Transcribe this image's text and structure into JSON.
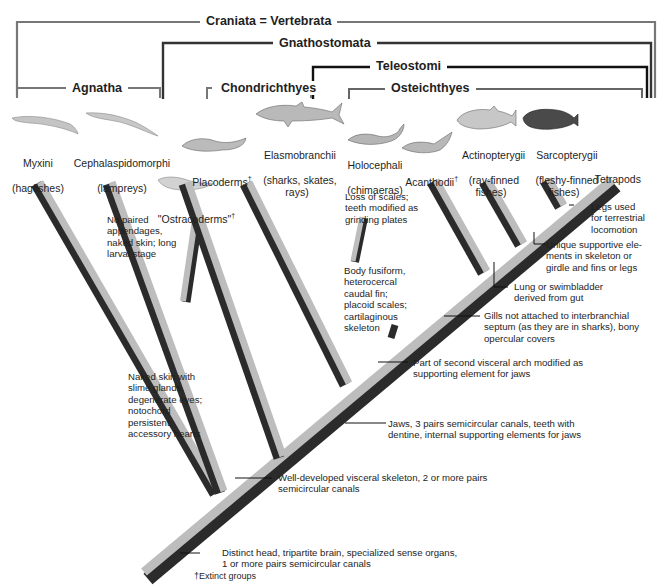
{
  "clades": {
    "craniata": "Craniata = Vertebrata",
    "gnathostomata": "Gnathostomata",
    "teleostomi": "Teleostomi",
    "osteichthyes": "Osteichthyes",
    "agnatha": "Agnatha",
    "chondrichthyes": "Chondrichthyes"
  },
  "taxa": [
    {
      "id": "myxini",
      "name": "Myxini",
      "common": "(hagfishes)",
      "extinct": false
    },
    {
      "id": "cephalaspidomorphi",
      "name": "Cephalaspidomorphi",
      "common": "(lampreys)",
      "extinct": false
    },
    {
      "id": "ostracoderms",
      "name": "\"Ostracoderms\"",
      "common": "",
      "extinct": true
    },
    {
      "id": "placoderms",
      "name": "Placoderms",
      "common": "",
      "extinct": true
    },
    {
      "id": "elasmobranchii",
      "name": "Elasmobranchii",
      "common": "(sharks, skates,\nrays)",
      "extinct": false
    },
    {
      "id": "holocephali",
      "name": "Holocephali",
      "common": "(chimaeras)",
      "extinct": false
    },
    {
      "id": "acanthodii",
      "name": "Acanthodii",
      "common": "",
      "extinct": true
    },
    {
      "id": "actinopterygii",
      "name": "Actinopterygii",
      "common": "(ray-finned\nfishes)",
      "extinct": false
    },
    {
      "id": "sarcopterygii",
      "name": "Sarcopterygii",
      "common": "(fleshy-finned\nfishes)",
      "extinct": false
    },
    {
      "id": "tetrapods",
      "name": "Tetrapods",
      "common": "",
      "extinct": false
    }
  ],
  "extinct_mark": "†",
  "characters": {
    "agnatha_lampreys": "No paired\nappendages,\nnaked skin; long\nlarval stage",
    "hagfish": "Naked skin with\nslime glands,\ndegenerate eyes;\nnotochord\npersistent;\naccessory hearts",
    "chimaera": "Loss of scales;\nteeth modified as\ngrinding plates",
    "chondrichthyes": "Body fusiform,\nheterocercal\ncaudal fin;\nplacoid scales;\ncartilaginous\nskeleton",
    "tetrapods": "Legs used\nfor terrestrial\nlocomotion",
    "sarcopterygii": "Unique supportive ele-\nments in skeleton or\ngirdle and fins or legs",
    "osteichthyes": "Lung or swimbladder\nderived from gut",
    "teleostomi": "Gills not attached to interbranchial\nseptum (as they are in sharks), bony\nopercular covers",
    "acanthodii_node": "Part of second visceral arch modified as\nsupporting element for jaws",
    "gnathostomata": "Jaws, 3 pairs semicircular canals, teeth with\ndentine, internal supporting elements for jaws",
    "vertebrata_node": "Well-developed visceral skeleton, 2 or more pairs\nsemicircular canals",
    "craniata": "Distinct head, tripartite brain, specialized sense organs,\n1 or more pairs semicircular canals"
  },
  "footnote": "†Extinct groups",
  "colors": {
    "branch_light": "#bdbdbd",
    "branch_dark": "#2b2b2b",
    "bracket_gray": "#7a7a7a",
    "bracket_black": "#111111"
  }
}
